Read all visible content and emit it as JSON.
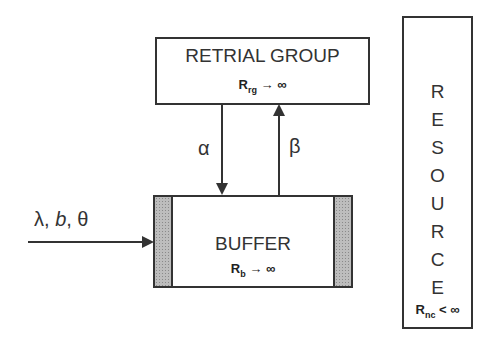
{
  "retrial_group": {
    "title": "RETRIAL GROUP",
    "formula_symbol": "R",
    "formula_sub": "rg",
    "formula_rest": " → ∞"
  },
  "buffer": {
    "title": "BUFFER",
    "formula_symbol": "R",
    "formula_sub": "b",
    "formula_rest": " → ∞"
  },
  "resource": {
    "letters": [
      "R",
      "E",
      "S",
      "O",
      "U",
      "R",
      "C",
      "E"
    ],
    "formula_symbol": "R",
    "formula_sub": "nc",
    "formula_rest": " < ∞"
  },
  "arrows": {
    "alpha_label": "α",
    "beta_label": "β",
    "input_label_lambda": "λ, ",
    "input_label_b": "b",
    "input_label_theta": ", θ"
  }
}
